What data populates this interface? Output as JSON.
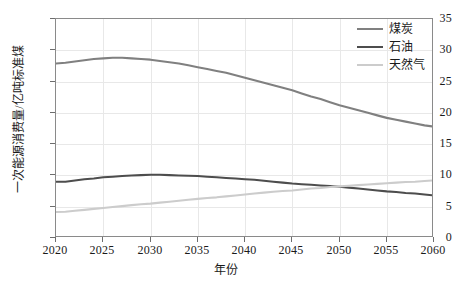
{
  "chart_data": {
    "type": "line",
    "title": "",
    "subtitle": "",
    "xlabel": "年份",
    "ylabel": "一次能源消费量/亿吨标准煤",
    "xlim": [
      2020,
      2060
    ],
    "ylim": [
      0,
      35
    ],
    "xticks": [
      2020,
      2025,
      2030,
      2035,
      2040,
      2045,
      2050,
      2055,
      2060
    ],
    "yticks": [
      0,
      5,
      10,
      15,
      20,
      25,
      30,
      35
    ],
    "grid": true,
    "legend_position": "top-right",
    "x": [
      2020,
      2021,
      2022,
      2023,
      2024,
      2025,
      2026,
      2027,
      2028,
      2029,
      2030,
      2031,
      2032,
      2033,
      2034,
      2035,
      2036,
      2037,
      2038,
      2039,
      2040,
      2041,
      2042,
      2043,
      2044,
      2045,
      2046,
      2047,
      2048,
      2049,
      2050,
      2051,
      2052,
      2053,
      2054,
      2055,
      2056,
      2057,
      2058,
      2059,
      2060
    ],
    "series": [
      {
        "name": "煤炭",
        "color": "#808080",
        "values": [
          27.9,
          28.0,
          28.2,
          28.4,
          28.6,
          28.7,
          28.8,
          28.8,
          28.7,
          28.6,
          28.5,
          28.3,
          28.1,
          27.9,
          27.6,
          27.3,
          27.0,
          26.7,
          26.4,
          26.0,
          25.6,
          25.2,
          24.8,
          24.4,
          24.0,
          23.6,
          23.1,
          22.6,
          22.2,
          21.7,
          21.2,
          20.8,
          20.4,
          20.0,
          19.6,
          19.2,
          18.9,
          18.6,
          18.3,
          18.0,
          17.8
        ]
      },
      {
        "name": "石油",
        "color": "#4d4d4d",
        "values": [
          9.0,
          9.0,
          9.2,
          9.4,
          9.5,
          9.7,
          9.8,
          9.9,
          10.0,
          10.05,
          10.1,
          10.1,
          10.05,
          10.0,
          9.95,
          9.9,
          9.8,
          9.7,
          9.6,
          9.5,
          9.4,
          9.3,
          9.15,
          9.0,
          8.85,
          8.7,
          8.6,
          8.5,
          8.4,
          8.3,
          8.2,
          8.05,
          7.9,
          7.75,
          7.6,
          7.45,
          7.35,
          7.2,
          7.1,
          6.95,
          6.8
        ]
      },
      {
        "name": "天然气",
        "color": "#cccccc",
        "values": [
          4.15,
          4.2,
          4.35,
          4.5,
          4.65,
          4.8,
          4.95,
          5.1,
          5.25,
          5.4,
          5.5,
          5.65,
          5.8,
          5.95,
          6.1,
          6.25,
          6.4,
          6.5,
          6.65,
          6.8,
          6.95,
          7.1,
          7.25,
          7.4,
          7.5,
          7.6,
          7.75,
          7.9,
          8.0,
          8.15,
          8.25,
          8.35,
          8.45,
          8.55,
          8.65,
          8.75,
          8.85,
          8.95,
          9.0,
          9.1,
          9.2
        ]
      }
    ]
  }
}
